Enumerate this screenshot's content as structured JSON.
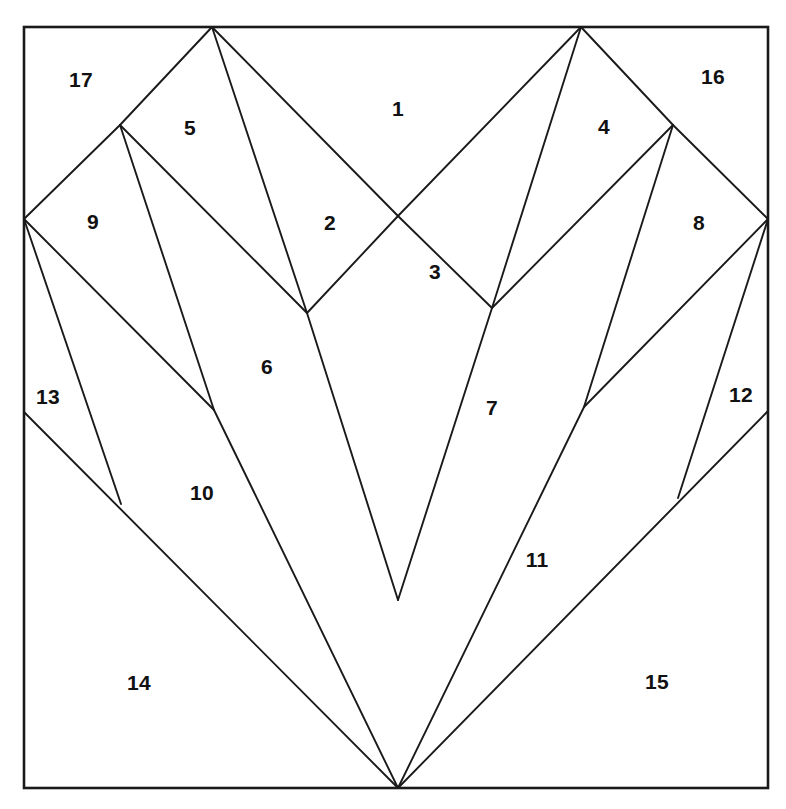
{
  "canvas": {
    "width": 786,
    "height": 809,
    "background_color": "#ffffff",
    "stroke_color": "#1a1a1a",
    "label_color": "#111111"
  },
  "frame": {
    "name": "outer-square-border",
    "x": 24,
    "y": 27,
    "width": 744,
    "height": 761
  },
  "chart_data": {
    "type": "diagram",
    "title": "",
    "subtitle": "",
    "xlabel": "",
    "ylabel": "",
    "region_count": 17,
    "labels": [
      {
        "id": 1,
        "text": "1",
        "x": 398,
        "y": 108
      },
      {
        "id": 2,
        "text": "2",
        "x": 330,
        "y": 222
      },
      {
        "id": 3,
        "text": "3",
        "x": 435,
        "y": 271
      },
      {
        "id": 4,
        "text": "4",
        "x": 604,
        "y": 126
      },
      {
        "id": 5,
        "text": "5",
        "x": 190,
        "y": 127
      },
      {
        "id": 6,
        "text": "6",
        "x": 267,
        "y": 366
      },
      {
        "id": 7,
        "text": "7",
        "x": 492,
        "y": 407
      },
      {
        "id": 8,
        "text": "8",
        "x": 699,
        "y": 222
      },
      {
        "id": 9,
        "text": "9",
        "x": 93,
        "y": 221
      },
      {
        "id": 10,
        "text": "10",
        "x": 202,
        "y": 492
      },
      {
        "id": 11,
        "text": "11",
        "x": 537,
        "y": 559
      },
      {
        "id": 12,
        "text": "12",
        "x": 741,
        "y": 394
      },
      {
        "id": 13,
        "text": "13",
        "x": 48,
        "y": 396
      },
      {
        "id": 14,
        "text": "14",
        "x": 139,
        "y": 682
      },
      {
        "id": 15,
        "text": "15",
        "x": 657,
        "y": 681
      },
      {
        "id": 16,
        "text": "16",
        "x": 713,
        "y": 76
      },
      {
        "id": 17,
        "text": "17",
        "x": 81,
        "y": 79
      }
    ],
    "vertices": {
      "frame_top_left": [
        24,
        27
      ],
      "frame_top_right": [
        768,
        27
      ],
      "frame_bottom_left": [
        24,
        788
      ],
      "frame_bottom_right": [
        768,
        788
      ],
      "left_peak": [
        212,
        27
      ],
      "right_peak": [
        581,
        27
      ],
      "left_shoulder": [
        120,
        125
      ],
      "right_shoulder": [
        673,
        125
      ],
      "left_edge_node": [
        24,
        219
      ],
      "right_edge_node": [
        768,
        219
      ],
      "inner_left_node": [
        307,
        313
      ],
      "inner_right_node": [
        492,
        308
      ],
      "mid_left_node": [
        214,
        410
      ],
      "mid_right_node": [
        584,
        407
      ],
      "lower_left_node": [
        121,
        504
      ],
      "lower_right_node": [
        678,
        498
      ],
      "left_border_13": [
        24,
        412
      ],
      "right_border_12": [
        768,
        411
      ],
      "bottom_v": [
        398,
        788
      ],
      "notch_left": [
        398,
        216
      ],
      "notch_right": [
        398,
        600
      ]
    },
    "segments": [
      {
        "name": "peakL-to-shoulderL",
        "from": [
          212,
          27
        ],
        "to": [
          120,
          125
        ]
      },
      {
        "name": "shoulderL-to-edgeL",
        "from": [
          120,
          125
        ],
        "to": [
          24,
          219
        ]
      },
      {
        "name": "peakL-to-innerL",
        "from": [
          212,
          27
        ],
        "to": [
          307,
          313
        ]
      },
      {
        "name": "peakL-to-notchL",
        "from": [
          212,
          27
        ],
        "to": [
          398,
          216
        ]
      },
      {
        "name": "notchL-to-innerL",
        "from": [
          398,
          216
        ],
        "to": [
          307,
          313
        ]
      },
      {
        "name": "shoulderL-to-innerL",
        "from": [
          120,
          125
        ],
        "to": [
          307,
          313
        ]
      },
      {
        "name": "shoulderL-to-midL",
        "from": [
          120,
          125
        ],
        "to": [
          214,
          410
        ]
      },
      {
        "name": "edgeL-to-midL",
        "from": [
          24,
          219
        ],
        "to": [
          214,
          410
        ]
      },
      {
        "name": "edgeL-to-lowerL",
        "from": [
          24,
          219
        ],
        "to": [
          121,
          504
        ]
      },
      {
        "name": "border13-to-bottomV",
        "from": [
          24,
          412
        ],
        "to": [
          398,
          788
        ]
      },
      {
        "name": "innerL-to-notchR",
        "from": [
          307,
          313
        ],
        "to": [
          398,
          600
        ]
      },
      {
        "name": "midL-to-bottomV",
        "from": [
          214,
          410
        ],
        "to": [
          398,
          788
        ]
      },
      {
        "name": "peakR-to-shoulderR",
        "from": [
          581,
          27
        ],
        "to": [
          673,
          125
        ]
      },
      {
        "name": "shoulderR-to-edgeR",
        "from": [
          673,
          125
        ],
        "to": [
          768,
          219
        ]
      },
      {
        "name": "peakR-to-innerR",
        "from": [
          581,
          27
        ],
        "to": [
          492,
          308
        ]
      },
      {
        "name": "peakR-to-notchL",
        "from": [
          581,
          27
        ],
        "to": [
          398,
          216
        ]
      },
      {
        "name": "notchL-to-innerR",
        "from": [
          398,
          216
        ],
        "to": [
          492,
          308
        ]
      },
      {
        "name": "shoulderR-to-innerR",
        "from": [
          673,
          125
        ],
        "to": [
          492,
          308
        ]
      },
      {
        "name": "shoulderR-to-midR",
        "from": [
          673,
          125
        ],
        "to": [
          584,
          407
        ]
      },
      {
        "name": "edgeR-to-midR",
        "from": [
          768,
          219
        ],
        "to": [
          584,
          407
        ]
      },
      {
        "name": "edgeR-to-lowerR",
        "from": [
          768,
          219
        ],
        "to": [
          678,
          498
        ]
      },
      {
        "name": "border12-to-bottomV",
        "from": [
          768,
          411
        ],
        "to": [
          398,
          788
        ]
      },
      {
        "name": "innerR-to-notchR",
        "from": [
          492,
          308
        ],
        "to": [
          398,
          600
        ]
      },
      {
        "name": "midR-to-bottomV",
        "from": [
          584,
          407
        ],
        "to": [
          398,
          788
        ]
      }
    ]
  }
}
